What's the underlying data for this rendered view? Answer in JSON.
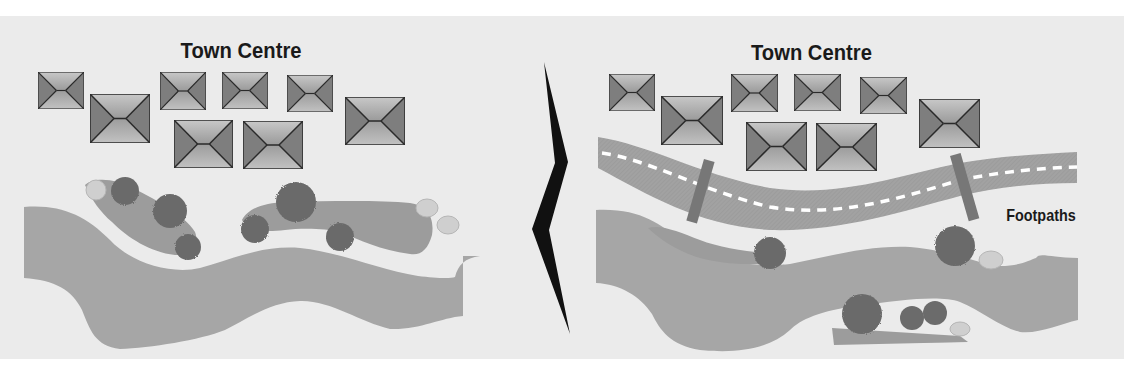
{
  "diagram": {
    "type": "before-after site plan comparison",
    "colors": {
      "background": "#ebebeb",
      "river": "#a6a6a6",
      "green_space": "#9c9c9c",
      "tree": "#6b6b6b",
      "shrub": "#cfcfcf",
      "road": "#a0a0a0",
      "road_markings": "#ffffff",
      "footpath": "#777777",
      "building_roof_light": "#b4b4b4",
      "building_roof_dark": "#8a8a8a",
      "divider_arrow": "#111111"
    },
    "left_panel": {
      "title": "Town Centre",
      "building_count": 8,
      "elements": [
        "buildings",
        "trees",
        "shrubs",
        "green spaces",
        "river"
      ]
    },
    "right_panel": {
      "title": "Town Centre",
      "building_count": 8,
      "callout": "Footpaths",
      "elements": [
        "buildings",
        "road",
        "footpaths",
        "trees",
        "shrubs",
        "green spaces",
        "river"
      ]
    },
    "divider": {
      "icon": "chevron-right-icon"
    }
  }
}
